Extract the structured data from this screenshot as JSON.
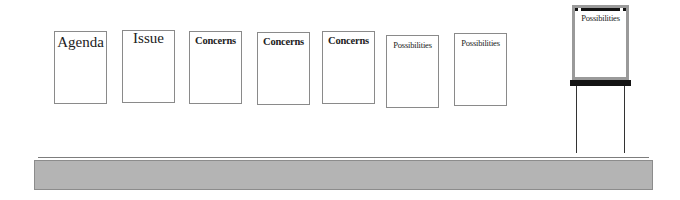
{
  "wall_sheets": [
    {
      "label": "Agenda"
    },
    {
      "label": "Issue"
    },
    {
      "label": "Concerns"
    },
    {
      "label": "Concerns"
    },
    {
      "label": "Concerns"
    },
    {
      "label": "Possibilities"
    },
    {
      "label": "Possibilities"
    }
  ],
  "flip_chart": {
    "label": "Possibilities"
  },
  "colors": {
    "sheet_border": "#8a8a8a",
    "flip_frame": "#9a9a9a",
    "flip_tray": "#141414",
    "table": "#b4b4b4"
  }
}
